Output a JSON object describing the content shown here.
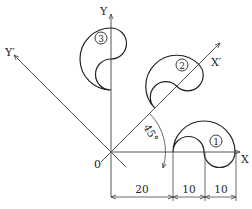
{
  "diagram": {
    "axes": {
      "x_label": "X",
      "y_label": "Y",
      "x_prime_label": "X′",
      "y_prime_label": "Y′",
      "origin_label": "0",
      "angle_label": "45°"
    },
    "shapes": [
      {
        "id": "shape-1",
        "label": "①",
        "rotation_deg": 0
      },
      {
        "id": "shape-2",
        "label": "②",
        "rotation_deg": 45
      },
      {
        "id": "shape-3",
        "label": "③",
        "rotation_deg": 90
      }
    ],
    "dimensions": [
      {
        "label": "20",
        "from": 0,
        "to": 20
      },
      {
        "label": "10",
        "from": 20,
        "to": 30
      },
      {
        "label": "10",
        "from": 30,
        "to": 40
      }
    ],
    "colors": {
      "line": "#222222",
      "axis": "#555555",
      "background": "#ffffff"
    }
  }
}
